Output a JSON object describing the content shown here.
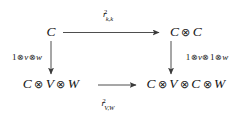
{
  "diagram": {
    "type": "commutative-square",
    "background_color": "#ffffff",
    "stroke_color": "#3a3a3a",
    "text_color": "#151515",
    "tensor_symbol": "⊗",
    "nodes": {
      "top_left": {
        "text": "C"
      },
      "top_right": {
        "text": "C ⊗ C"
      },
      "bottom_left": {
        "text": "C ⊗ V ⊗ W"
      },
      "bottom_right": {
        "text": "C ⊗ V ⊗ C ⊗ W"
      }
    },
    "arrows": {
      "top": {
        "direction": "right",
        "from": "top_left",
        "to": "top_right",
        "label": {
          "base": "r",
          "superscript": "2",
          "subscript": "k,k",
          "plain": "r^2_{k,k}"
        }
      },
      "bottom": {
        "direction": "right",
        "from": "bottom_left",
        "to": "bottom_right",
        "label": {
          "base": "r",
          "superscript": "2",
          "subscript": "V,W",
          "plain": "r^2_{V,W}"
        }
      },
      "left": {
        "direction": "down",
        "from": "top_left",
        "to": "bottom_left",
        "label": {
          "plain": "1⊗v⊗w"
        }
      },
      "right": {
        "direction": "down",
        "from": "top_right",
        "to": "bottom_right",
        "label": {
          "plain": "1⊗v⊗1⊗w"
        }
      }
    }
  }
}
